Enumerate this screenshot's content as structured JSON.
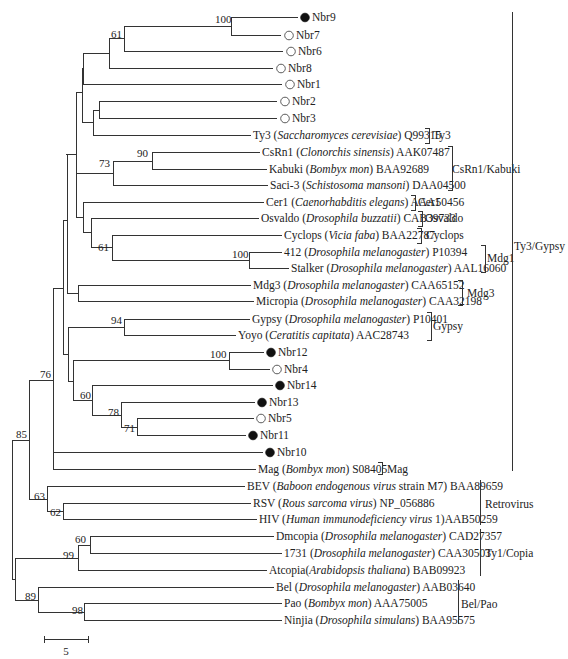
{
  "figure": {
    "type": "phylogenetic-tree",
    "scale_bar": {
      "label": "5",
      "x1": 44,
      "x2": 88,
      "y": 639
    }
  },
  "leaves": [
    {
      "id": "Nbr9",
      "y": 17,
      "x": 300,
      "marker": "filled",
      "parts": [
        {
          "t": "Nbr9"
        }
      ]
    },
    {
      "id": "Nbr7",
      "y": 35,
      "x": 284,
      "marker": "open",
      "parts": [
        {
          "t": "Nbr7"
        }
      ]
    },
    {
      "id": "Nbr6",
      "y": 51,
      "x": 286,
      "marker": "open",
      "parts": [
        {
          "t": "Nbr6"
        }
      ]
    },
    {
      "id": "Nbr8",
      "y": 68,
      "x": 276,
      "marker": "open",
      "parts": [
        {
          "t": "Nbr8"
        }
      ]
    },
    {
      "id": "Nbr1",
      "y": 84,
      "x": 285,
      "marker": "open",
      "parts": [
        {
          "t": "Nbr1"
        }
      ]
    },
    {
      "id": "Nbr2",
      "y": 101,
      "x": 280,
      "marker": "open",
      "parts": [
        {
          "t": "Nbr2"
        }
      ]
    },
    {
      "id": "Nbr3",
      "y": 118,
      "x": 280,
      "marker": "open",
      "parts": [
        {
          "t": "Nbr3"
        }
      ]
    },
    {
      "id": "Ty3",
      "y": 135,
      "x": 253,
      "parts": [
        {
          "t": "Ty3 ("
        },
        {
          "t": "Saccharomyces cerevisiae",
          "i": true
        },
        {
          "t": ") Q99315"
        }
      ]
    },
    {
      "id": "CsRn1",
      "y": 152,
      "x": 262,
      "parts": [
        {
          "t": "CsRn1 ("
        },
        {
          "t": "Clonorchis sinensis",
          "i": true
        },
        {
          "t": ") AAK07487"
        }
      ]
    },
    {
      "id": "Kabuki",
      "y": 169,
      "x": 269,
      "parts": [
        {
          "t": "Kabuki ("
        },
        {
          "t": "Bombyx mon",
          "i": true
        },
        {
          "t": ") BAA92689"
        }
      ]
    },
    {
      "id": "Saci-3",
      "y": 185,
      "x": 270,
      "parts": [
        {
          "t": "Saci-3 ("
        },
        {
          "t": "Schistosoma mansoni",
          "i": true
        },
        {
          "t": ") DAA04500"
        }
      ]
    },
    {
      "id": "Cer1",
      "y": 202,
      "x": 266,
      "parts": [
        {
          "t": "Cer1 ("
        },
        {
          "t": "Caenorhabditis elegans",
          "i": true
        },
        {
          "t": ") AAA50456"
        }
      ]
    },
    {
      "id": "Osvaldo",
      "y": 218,
      "x": 261,
      "parts": [
        {
          "t": "Osvaldo ("
        },
        {
          "t": "Drosophila buzzatii",
          "i": true
        },
        {
          "t": ") CAB39733"
        }
      ]
    },
    {
      "id": "Cyclops",
      "y": 235,
      "x": 284,
      "parts": [
        {
          "t": "Cyclops ("
        },
        {
          "t": "Vicia faba",
          "i": true
        },
        {
          "t": ") BAA22787"
        }
      ]
    },
    {
      "id": "412",
      "y": 252,
      "x": 284,
      "parts": [
        {
          "t": "412 ("
        },
        {
          "t": "Drosophila melanogaster",
          "i": true
        },
        {
          "t": ") P10394"
        }
      ]
    },
    {
      "id": "Stalker",
      "y": 268,
      "x": 291,
      "parts": [
        {
          "t": "Stalker ("
        },
        {
          "t": "Drosophila melanogaster",
          "i": true
        },
        {
          "t": ") AAL16060"
        }
      ]
    },
    {
      "id": "Mdg3",
      "y": 285,
      "x": 253,
      "parts": [
        {
          "t": "Mdg3 ("
        },
        {
          "t": "Drosophila melanogaster",
          "i": true
        },
        {
          "t": ") CAA65152"
        }
      ]
    },
    {
      "id": "Micropia",
      "y": 301,
      "x": 256,
      "parts": [
        {
          "t": "Micropia ("
        },
        {
          "t": "Drosophila melanogaster",
          "i": true
        },
        {
          "t": ") CAA32198"
        }
      ]
    },
    {
      "id": "Gypsy",
      "y": 319,
      "x": 252,
      "parts": [
        {
          "t": "Gypsy ("
        },
        {
          "t": "Drosophila melanogaster",
          "i": true
        },
        {
          "t": ") P10401"
        }
      ]
    },
    {
      "id": "Yoyo",
      "y": 335,
      "x": 238,
      "parts": [
        {
          "t": "Yoyo ("
        },
        {
          "t": "Ceratitis capitata",
          "i": true
        },
        {
          "t": ") AAC28743"
        }
      ]
    },
    {
      "id": "Nbr12",
      "y": 352,
      "x": 266,
      "marker": "filled",
      "parts": [
        {
          "t": "Nbr12"
        }
      ]
    },
    {
      "id": "Nbr4",
      "y": 369,
      "x": 272,
      "marker": "open",
      "parts": [
        {
          "t": "Nbr4"
        }
      ]
    },
    {
      "id": "Nbr14",
      "y": 385,
      "x": 275,
      "marker": "filled",
      "parts": [
        {
          "t": "Nbr14"
        }
      ]
    },
    {
      "id": "Nbr13",
      "y": 402,
      "x": 257,
      "marker": "filled",
      "parts": [
        {
          "t": "Nbr13"
        }
      ]
    },
    {
      "id": "Nbr5",
      "y": 418,
      "x": 256,
      "marker": "open",
      "parts": [
        {
          "t": "Nbr5"
        }
      ]
    },
    {
      "id": "Nbr11",
      "y": 435,
      "x": 248,
      "marker": "filled",
      "parts": [
        {
          "t": "Nbr11"
        }
      ]
    },
    {
      "id": "Nbr10",
      "y": 452,
      "x": 265,
      "marker": "filled",
      "parts": [
        {
          "t": "Nbr10"
        }
      ]
    },
    {
      "id": "Mag",
      "y": 469,
      "x": 258,
      "parts": [
        {
          "t": "Mag ("
        },
        {
          "t": "Bombyx mon",
          "i": true
        },
        {
          "t": ") S08405"
        }
      ]
    },
    {
      "id": "BEV",
      "y": 486,
      "x": 247,
      "parts": [
        {
          "t": "BEV ("
        },
        {
          "t": "Baboon endogenous virus",
          "i": true
        },
        {
          "t": " strain M7) BAA89659"
        }
      ]
    },
    {
      "id": "RSV",
      "y": 503,
      "x": 253,
      "parts": [
        {
          "t": "RSV ("
        },
        {
          "t": "Rous sarcoma virus",
          "i": true
        },
        {
          "t": ") NP_056886"
        }
      ]
    },
    {
      "id": "HIV",
      "y": 519,
      "x": 259,
      "parts": [
        {
          "t": "HIV ("
        },
        {
          "t": "Human immunodeficiency virus",
          "i": true
        },
        {
          "t": " 1)AAB50259"
        }
      ]
    },
    {
      "id": "Dmcopia",
      "y": 536,
      "x": 276,
      "parts": [
        {
          "t": "Dmcopia ("
        },
        {
          "t": "Drosophila melanogaster",
          "i": true
        },
        {
          "t": ") CAD27357"
        }
      ]
    },
    {
      "id": "1731",
      "y": 553,
      "x": 284,
      "parts": [
        {
          "t": "1731 ("
        },
        {
          "t": "Drosophila melanogaster",
          "i": true
        },
        {
          "t": ") CAA30503"
        }
      ]
    },
    {
      "id": "Atcopia",
      "y": 570,
      "x": 269,
      "parts": [
        {
          "t": "Atcopia("
        },
        {
          "t": "Arabidopsis thaliana",
          "i": true
        },
        {
          "t": ") BAB09923"
        }
      ]
    },
    {
      "id": "Bel",
      "y": 587,
      "x": 276,
      "parts": [
        {
          "t": "Bel ("
        },
        {
          "t": "Drosophila melanogaster",
          "i": true
        },
        {
          "t": ") AAB03640"
        }
      ]
    },
    {
      "id": "Pao",
      "y": 603,
      "x": 284,
      "parts": [
        {
          "t": "Pao ("
        },
        {
          "t": "Bombyx mon",
          "i": true
        },
        {
          "t": ") AAA75005"
        }
      ]
    },
    {
      "id": "Ninjia",
      "y": 620,
      "x": 284,
      "parts": [
        {
          "t": "Ninjia ("
        },
        {
          "t": "Drosophila simulans",
          "i": true
        },
        {
          "t": ") BAA95575"
        }
      ]
    }
  ],
  "branches": [
    {
      "k": "h",
      "x1": 231,
      "x2": 298,
      "y": 17
    },
    {
      "k": "h",
      "x1": 231,
      "x2": 281,
      "y": 35
    },
    {
      "k": "v",
      "x": 231,
      "y1": 17,
      "y2": 35
    },
    {
      "k": "h",
      "x1": 124,
      "x2": 231,
      "y": 26
    },
    {
      "k": "h",
      "x1": 124,
      "x2": 283,
      "y": 51
    },
    {
      "k": "v",
      "x": 124,
      "y1": 26,
      "y2": 51
    },
    {
      "k": "h",
      "x1": 109,
      "x2": 124,
      "y": 38
    },
    {
      "k": "h",
      "x1": 109,
      "x2": 273,
      "y": 68
    },
    {
      "k": "v",
      "x": 109,
      "y1": 38,
      "y2": 68
    },
    {
      "k": "h",
      "x1": 83,
      "x2": 109,
      "y": 53
    },
    {
      "k": "h",
      "x1": 83,
      "x2": 282,
      "y": 84
    },
    {
      "k": "v",
      "x": 83,
      "y1": 53,
      "y2": 84
    },
    {
      "k": "h",
      "x1": 99,
      "x2": 277,
      "y": 101
    },
    {
      "k": "h",
      "x1": 99,
      "x2": 277,
      "y": 118
    },
    {
      "k": "v",
      "x": 99,
      "y1": 101,
      "y2": 118
    },
    {
      "k": "h",
      "x1": 93,
      "x2": 99,
      "y": 110
    },
    {
      "k": "h",
      "x1": 93,
      "x2": 251,
      "y": 135
    },
    {
      "k": "v",
      "x": 93,
      "y1": 110,
      "y2": 135
    },
    {
      "k": "h",
      "x1": 82,
      "x2": 93,
      "y": 122
    },
    {
      "k": "v",
      "x": 82,
      "y1": 68,
      "y2": 122
    },
    {
      "k": "h",
      "x1": 76,
      "x2": 82,
      "y": 92
    },
    {
      "k": "h",
      "x1": 152,
      "x2": 260,
      "y": 152
    },
    {
      "k": "h",
      "x1": 152,
      "x2": 267,
      "y": 169
    },
    {
      "k": "v",
      "x": 152,
      "y1": 152,
      "y2": 169
    },
    {
      "k": "h",
      "x1": 113,
      "x2": 152,
      "y": 161
    },
    {
      "k": "h",
      "x1": 113,
      "x2": 268,
      "y": 185
    },
    {
      "k": "v",
      "x": 113,
      "y1": 161,
      "y2": 185
    },
    {
      "k": "h",
      "x1": 76,
      "x2": 113,
      "y": 173
    },
    {
      "k": "h",
      "x1": 112,
      "x2": 282,
      "y": 235
    },
    {
      "k": "h",
      "x1": 249,
      "x2": 282,
      "y": 252
    },
    {
      "k": "h",
      "x1": 249,
      "x2": 289,
      "y": 268
    },
    {
      "k": "v",
      "x": 249,
      "y1": 252,
      "y2": 268
    },
    {
      "k": "h",
      "x1": 112,
      "x2": 249,
      "y": 260
    },
    {
      "k": "v",
      "x": 112,
      "y1": 235,
      "y2": 260
    },
    {
      "k": "h",
      "x1": 91,
      "x2": 112,
      "y": 247
    },
    {
      "k": "h",
      "x1": 91,
      "x2": 259,
      "y": 218
    },
    {
      "k": "v",
      "x": 91,
      "y1": 218,
      "y2": 247
    },
    {
      "k": "h",
      "x1": 83,
      "x2": 91,
      "y": 232
    },
    {
      "k": "h",
      "x1": 83,
      "x2": 264,
      "y": 202
    },
    {
      "k": "v",
      "x": 83,
      "y1": 202,
      "y2": 232
    },
    {
      "k": "h",
      "x1": 76,
      "x2": 83,
      "y": 217
    },
    {
      "k": "v",
      "x": 76,
      "y1": 92,
      "y2": 217
    },
    {
      "k": "h",
      "x1": 66,
      "x2": 76,
      "y": 154
    },
    {
      "k": "h",
      "x1": 78,
      "x2": 251,
      "y": 285
    },
    {
      "k": "h",
      "x1": 78,
      "x2": 254,
      "y": 301
    },
    {
      "k": "v",
      "x": 78,
      "y1": 285,
      "y2": 301
    },
    {
      "k": "h",
      "x1": 67,
      "x2": 78,
      "y": 293
    },
    {
      "k": "v",
      "x": 67,
      "y1": 154,
      "y2": 293
    },
    {
      "k": "h",
      "x1": 63,
      "x2": 67,
      "y": 220
    },
    {
      "k": "h",
      "x1": 124,
      "x2": 250,
      "y": 319
    },
    {
      "k": "h",
      "x1": 124,
      "x2": 236,
      "y": 335
    },
    {
      "k": "v",
      "x": 124,
      "y1": 319,
      "y2": 335
    },
    {
      "k": "h",
      "x1": 68,
      "x2": 124,
      "y": 327
    },
    {
      "k": "h",
      "x1": 229,
      "x2": 264,
      "y": 352
    },
    {
      "k": "h",
      "x1": 229,
      "x2": 270,
      "y": 369
    },
    {
      "k": "v",
      "x": 229,
      "y1": 352,
      "y2": 369
    },
    {
      "k": "h",
      "x1": 73,
      "x2": 229,
      "y": 360
    },
    {
      "k": "h",
      "x1": 92,
      "x2": 273,
      "y": 385
    },
    {
      "k": "h",
      "x1": 121,
      "x2": 255,
      "y": 402
    },
    {
      "k": "h",
      "x1": 137,
      "x2": 254,
      "y": 418
    },
    {
      "k": "h",
      "x1": 137,
      "x2": 246,
      "y": 435
    },
    {
      "k": "v",
      "x": 137,
      "y1": 418,
      "y2": 435
    },
    {
      "k": "h",
      "x1": 121,
      "x2": 137,
      "y": 427
    },
    {
      "k": "v",
      "x": 121,
      "y1": 402,
      "y2": 427
    },
    {
      "k": "h",
      "x1": 92,
      "x2": 121,
      "y": 415
    },
    {
      "k": "v",
      "x": 92,
      "y1": 385,
      "y2": 415
    },
    {
      "k": "h",
      "x1": 73,
      "x2": 92,
      "y": 400
    },
    {
      "k": "v",
      "x": 73,
      "y1": 360,
      "y2": 400
    },
    {
      "k": "h",
      "x1": 68,
      "x2": 73,
      "y": 381
    },
    {
      "k": "v",
      "x": 68,
      "y1": 327,
      "y2": 381
    },
    {
      "k": "h",
      "x1": 63,
      "x2": 68,
      "y": 354
    },
    {
      "k": "v",
      "x": 63,
      "y1": 220,
      "y2": 354
    },
    {
      "k": "h",
      "x1": 53,
      "x2": 63,
      "y": 288
    },
    {
      "k": "h",
      "x1": 53,
      "x2": 263,
      "y": 452
    },
    {
      "k": "h",
      "x1": 53,
      "x2": 256,
      "y": 469
    },
    {
      "k": "v",
      "x": 53,
      "y1": 288,
      "y2": 469
    },
    {
      "k": "h",
      "x1": 29,
      "x2": 53,
      "y": 380
    },
    {
      "k": "h",
      "x1": 47,
      "x2": 245,
      "y": 486
    },
    {
      "k": "h",
      "x1": 63,
      "x2": 251,
      "y": 503
    },
    {
      "k": "h",
      "x1": 63,
      "x2": 257,
      "y": 519
    },
    {
      "k": "v",
      "x": 63,
      "y1": 503,
      "y2": 519
    },
    {
      "k": "h",
      "x1": 47,
      "x2": 63,
      "y": 511
    },
    {
      "k": "v",
      "x": 47,
      "y1": 486,
      "y2": 511
    },
    {
      "k": "h",
      "x1": 29,
      "x2": 47,
      "y": 499
    },
    {
      "k": "v",
      "x": 29,
      "y1": 380,
      "y2": 499
    },
    {
      "k": "h",
      "x1": 12,
      "x2": 29,
      "y": 440
    },
    {
      "k": "h",
      "x1": 90,
      "x2": 274,
      "y": 536
    },
    {
      "k": "h",
      "x1": 90,
      "x2": 282,
      "y": 553
    },
    {
      "k": "v",
      "x": 90,
      "y1": 536,
      "y2": 553
    },
    {
      "k": "h",
      "x1": 78,
      "x2": 90,
      "y": 545
    },
    {
      "k": "h",
      "x1": 78,
      "x2": 267,
      "y": 570
    },
    {
      "k": "v",
      "x": 78,
      "y1": 545,
      "y2": 570
    },
    {
      "k": "h",
      "x1": 15,
      "x2": 78,
      "y": 558
    },
    {
      "k": "h",
      "x1": 38,
      "x2": 274,
      "y": 587
    },
    {
      "k": "h",
      "x1": 84,
      "x2": 282,
      "y": 603
    },
    {
      "k": "h",
      "x1": 84,
      "x2": 282,
      "y": 620
    },
    {
      "k": "v",
      "x": 84,
      "y1": 603,
      "y2": 620
    },
    {
      "k": "h",
      "x1": 38,
      "x2": 84,
      "y": 612
    },
    {
      "k": "v",
      "x": 38,
      "y1": 587,
      "y2": 612
    },
    {
      "k": "h",
      "x1": 15,
      "x2": 38,
      "y": 600
    },
    {
      "k": "v",
      "x": 15,
      "y1": 558,
      "y2": 600
    },
    {
      "k": "h",
      "x1": 12,
      "x2": 15,
      "y": 579
    },
    {
      "k": "v",
      "x": 12,
      "y1": 440,
      "y2": 579
    }
  ],
  "bootstrap": [
    {
      "v": "100",
      "x": 215,
      "y": 23
    },
    {
      "v": "61",
      "x": 111,
      "y": 38
    },
    {
      "v": "90",
      "x": 137,
      "y": 157
    },
    {
      "v": "73",
      "x": 99,
      "y": 167
    },
    {
      "v": "61",
      "x": 98,
      "y": 251
    },
    {
      "v": "100",
      "x": 232,
      "y": 258
    },
    {
      "v": "94",
      "x": 111,
      "y": 324
    },
    {
      "v": "100",
      "x": 210,
      "y": 358
    },
    {
      "v": "60",
      "x": 80,
      "y": 399
    },
    {
      "v": "78",
      "x": 108,
      "y": 416
    },
    {
      "v": "71",
      "x": 124,
      "y": 432
    },
    {
      "v": "76",
      "x": 40,
      "y": 378
    },
    {
      "v": "85",
      "x": 16,
      "y": 438
    },
    {
      "v": "63",
      "x": 34,
      "y": 500
    },
    {
      "v": "62",
      "x": 50,
      "y": 516
    },
    {
      "v": "60",
      "x": 75,
      "y": 543
    },
    {
      "v": "99",
      "x": 63,
      "y": 559
    },
    {
      "v": "89",
      "x": 25,
      "y": 600
    },
    {
      "v": "98",
      "x": 72,
      "y": 614
    }
  ],
  "families": [
    {
      "name": "Ty3",
      "label": "Ty3",
      "x": 429,
      "y1": 128,
      "y2": 143,
      "lx": 433,
      "ly": 139
    },
    {
      "name": "CsRn1/Kabuki",
      "label": "CsRn1/Kabuki",
      "x": 452,
      "y1": 146,
      "y2": 190,
      "lx": 452,
      "ly": 173
    },
    {
      "name": "Cer1",
      "label": "Cer1",
      "x": 415,
      "y1": 195,
      "y2": 210,
      "lx": 418,
      "ly": 206
    },
    {
      "name": "Osvaldo",
      "label": "Osvaldo",
      "x": 422,
      "y1": 211,
      "y2": 226,
      "lx": 425,
      "ly": 222
    },
    {
      "name": "Cyclops",
      "label": "Cyclops",
      "x": 421,
      "y1": 228,
      "y2": 243,
      "lx": 426,
      "ly": 239
    },
    {
      "name": "Mdg1",
      "label": "Mdg1",
      "x": 485,
      "y1": 245,
      "y2": 272,
      "lx": 487,
      "ly": 262
    },
    {
      "name": "Mdg3",
      "label": "Mdg3",
      "x": 462,
      "y1": 280,
      "y2": 305,
      "lx": 467,
      "ly": 297
    },
    {
      "name": "Gypsy",
      "label": "Gypsy",
      "x": 431,
      "y1": 312,
      "y2": 340,
      "lx": 433,
      "ly": 330
    },
    {
      "name": "Mag",
      "label": "Mag",
      "x": 382,
      "y1": 462,
      "y2": 474,
      "lx": 387,
      "ly": 473
    },
    {
      "name": "Ty3/Gypsy",
      "label": "Ty3/Gypsy",
      "x": 512,
      "y1": 12,
      "y2": 471,
      "lx": 514,
      "ly": 250,
      "plain": true
    },
    {
      "name": "Retrovirus",
      "label": "Retrovirus",
      "x": 480,
      "y1": 480,
      "y2": 525,
      "lx": 485,
      "ly": 508,
      "plain": true
    },
    {
      "name": "Ty1/Copia",
      "label": "Ty1/Copia",
      "x": 480,
      "y1": 529,
      "y2": 576,
      "lx": 485,
      "ly": 557,
      "plain": true
    },
    {
      "name": "Bel/Pao",
      "label": "Bel/Pao",
      "x": 458,
      "y1": 580,
      "y2": 624,
      "lx": 461,
      "ly": 608,
      "plain": true
    }
  ]
}
